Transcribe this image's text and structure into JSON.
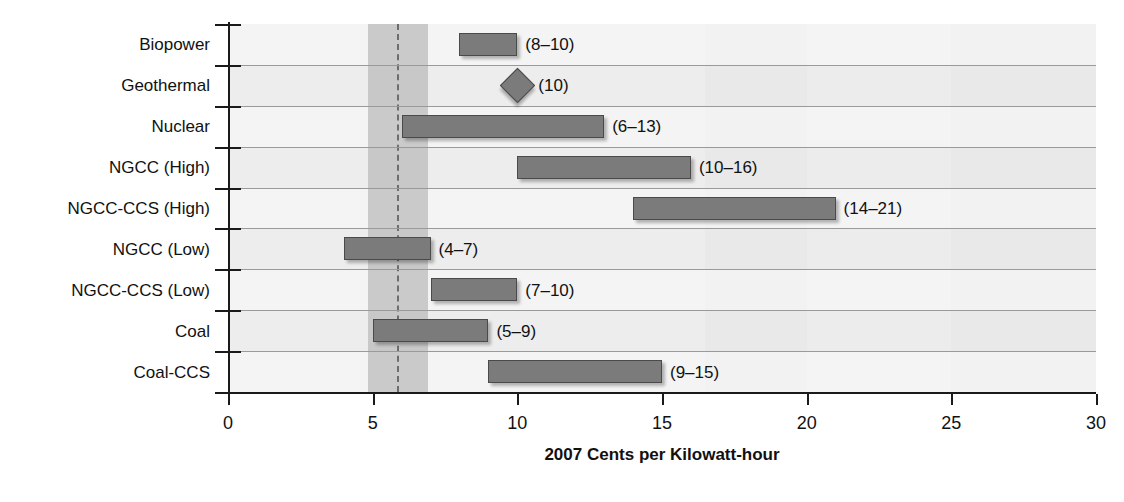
{
  "chart_data": {
    "type": "bar",
    "subtype": "range-bar",
    "title": "",
    "xlabel": "2007 Cents per Kilowatt-hour",
    "ylabel": "Energy Source",
    "xlim": [
      0,
      30
    ],
    "xticks": [
      "0",
      "5",
      "10",
      "15",
      "20",
      "25",
      "30"
    ],
    "grid": true,
    "legend": "none",
    "categories": [
      "Biopower",
      "Geothermal",
      "Nuclear",
      "NGCC (High)",
      "NGCC-CCS (High)",
      "NGCC (Low)",
      "NGCC-CCS (Low)",
      "Coal",
      "Coal-CCS"
    ],
    "ranges": [
      {
        "category": "Biopower",
        "low": 8,
        "high": 10,
        "label": "(8–10)",
        "marker": "bar"
      },
      {
        "category": "Geothermal",
        "low": 10,
        "high": 10,
        "label": "(10)",
        "marker": "diamond"
      },
      {
        "category": "Nuclear",
        "low": 6,
        "high": 13,
        "label": "(6–13)",
        "marker": "bar"
      },
      {
        "category": "NGCC (High)",
        "low": 10,
        "high": 16,
        "label": "(10–16)",
        "marker": "bar"
      },
      {
        "category": "NGCC-CCS (High)",
        "low": 14,
        "high": 21,
        "label": "(14–21)",
        "marker": "bar"
      },
      {
        "category": "NGCC (Low)",
        "low": 4,
        "high": 7,
        "label": "(4–7)",
        "marker": "bar"
      },
      {
        "category": "NGCC-CCS (Low)",
        "low": 7,
        "high": 10,
        "label": "(7–10)",
        "marker": "bar"
      },
      {
        "category": "Coal",
        "low": 5,
        "high": 9,
        "label": "(5–9)",
        "marker": "bar"
      },
      {
        "category": "Coal-CCS",
        "low": 9,
        "high": 15,
        "label": "(9–15)",
        "marker": "bar"
      }
    ],
    "reference_band": {
      "low": 4.85,
      "high": 6.9
    },
    "reference_line": {
      "value": 5.85,
      "style": "dashed"
    },
    "background_bands": [
      {
        "from": 0,
        "to": 4.85,
        "shade": "#f0f0f0"
      },
      {
        "from": 4.85,
        "to": 6.9,
        "shade": "#c8c8c8"
      },
      {
        "from": 6.9,
        "to": 16.5,
        "shade": "#f0f0f0"
      },
      {
        "from": 16.5,
        "to": 20,
        "shade": "#ececec"
      },
      {
        "from": 20,
        "to": 25,
        "shade": "#efefef"
      },
      {
        "from": 25,
        "to": 30,
        "shade": "#ececec"
      }
    ],
    "colors": {
      "bar_fill": "#7b7b7b",
      "bar_stroke": "#4a4a4a",
      "plot_background": "#f0f0f0",
      "band_highlight": "#c8c8c8",
      "axis": "#1a1a1a",
      "gridline": "#9a9a9a",
      "text": "#111111"
    }
  }
}
